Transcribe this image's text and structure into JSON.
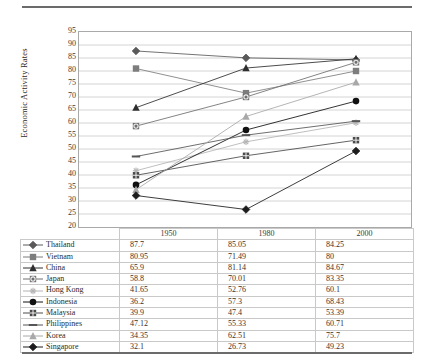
{
  "chart_data": {
    "type": "line",
    "title": "",
    "xlabel": "",
    "ylabel": "Economic Activity Rates",
    "categories": [
      "1950",
      "1980",
      "2000"
    ],
    "ylim": [
      20,
      95
    ],
    "ytick_step": 5,
    "yticks": [
      95,
      90,
      85,
      80,
      75,
      70,
      65,
      60,
      55,
      50,
      45,
      40,
      35,
      30,
      25,
      20
    ],
    "grid": true,
    "legend": "table-below",
    "series": [
      {
        "name": "Thailand",
        "marker": "diamond",
        "color": "#5a5a5a",
        "values": [
          87.7,
          85.05,
          84.25
        ]
      },
      {
        "name": "Vietnam",
        "marker": "square",
        "color": "#7d7d7d",
        "values": [
          80.95,
          71.49,
          80
        ]
      },
      {
        "name": "China",
        "marker": "triangle",
        "color": "#2e2e2e",
        "values": [
          65.9,
          81.14,
          84.67
        ]
      },
      {
        "name": "Japan",
        "marker": "circled-square",
        "color": "#6f6f6f",
        "values": [
          58.8,
          70.01,
          83.35
        ]
      },
      {
        "name": "Hong Kong",
        "marker": "asterisk",
        "color": "#b4b4b4",
        "values": [
          41.65,
          52.76,
          60.1
        ]
      },
      {
        "name": "Indonesia",
        "marker": "circle",
        "color": "#111111",
        "values": [
          36.2,
          57.3,
          68.43
        ]
      },
      {
        "name": "Malaysia",
        "marker": "crossed-square",
        "color": "#4a4a4a",
        "values": [
          39.9,
          47.4,
          53.39
        ]
      },
      {
        "name": "Philippines",
        "marker": "dash",
        "color": "#555555",
        "values": [
          47.12,
          55.33,
          60.71
        ]
      },
      {
        "name": "Korea",
        "marker": "triangle-light",
        "color": "#a8a8a8",
        "values": [
          34.35,
          62.51,
          75.7
        ]
      },
      {
        "name": "Singapore",
        "marker": "diamond-dark",
        "color": "#1c1c1c",
        "values": [
          32.1,
          26.73,
          49.23
        ]
      }
    ]
  },
  "table": {
    "corner_label": "",
    "columns": [
      "1950",
      "1980",
      "2000"
    ],
    "rows": [
      {
        "name": "Thailand",
        "v1950": "87.7",
        "v1980": "85.05",
        "v2000": "84.25"
      },
      {
        "name": "Vietnam",
        "v1950": "80.95",
        "v1980": "71.49",
        "v2000": "80"
      },
      {
        "name": "China",
        "v1950": "65.9",
        "v1980": "81.14",
        "v2000": "84.67"
      },
      {
        "name": "Japan",
        "v1950": "58.8",
        "v1980": "70.01",
        "v2000": "83.35"
      },
      {
        "name": "Hong Kong",
        "v1950": "41.65",
        "v1980": "52.76",
        "v2000": "60.1"
      },
      {
        "name": "Indonesia",
        "v1950": "36.2",
        "v1980": "57.3",
        "v2000": "68.43"
      },
      {
        "name": "Malaysia",
        "v1950": "39.9",
        "v1980": "47.4",
        "v2000": "53.39"
      },
      {
        "name": "Philippines",
        "v1950": "47.12",
        "v1980": "55.33",
        "v2000": "60.71"
      },
      {
        "name": "Korea",
        "v1950": "34.35",
        "v1980": "62.51",
        "v2000": "75.7"
      },
      {
        "name": "Singapore",
        "v1950": "32.1",
        "v1980": "26.73",
        "v2000": "49.23"
      }
    ]
  },
  "colors": {
    "grid": "#d4d4d4",
    "axis": "#a9a9a9",
    "rule": "#6b6b6b",
    "text": "#2b2b2b"
  }
}
